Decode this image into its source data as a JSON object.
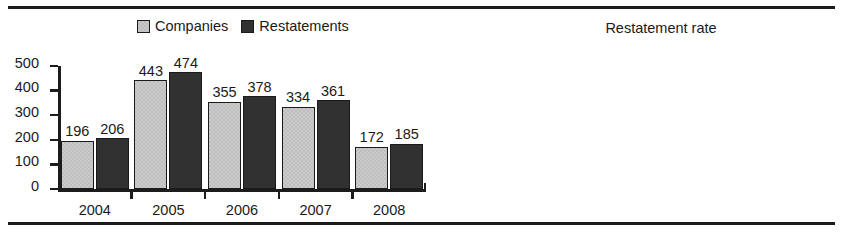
{
  "rules": {
    "top": "",
    "bottom": ""
  },
  "legend": {
    "items": [
      {
        "label": "Companies",
        "key": "companies",
        "color": "#cacaca"
      },
      {
        "label": "Restatements",
        "key": "restatements",
        "color": "#313131"
      }
    ]
  },
  "chart_data": [
    {
      "id": "counts",
      "type": "bar",
      "title": "",
      "xlabel": "",
      "ylabel": "",
      "ylim": [
        0,
        500
      ],
      "yticks": [
        0,
        100,
        200,
        300,
        400,
        500
      ],
      "ytick_labels": [
        "0",
        "100",
        "200",
        "300",
        "400",
        "500"
      ],
      "grid": false,
      "legend_position": "top-center",
      "categories": [
        "2004",
        "2005",
        "2006",
        "2007",
        "2008"
      ],
      "series": [
        {
          "name": "Companies",
          "color": "#cacaca",
          "values": [
            196,
            206,
            443,
            474,
            355,
            378,
            334,
            361,
            172,
            185
          ]
        }
      ],
      "grouped_series": [
        {
          "name": "Companies",
          "color": "#cacaca",
          "values": [
            196,
            443,
            355,
            334,
            172
          ]
        },
        {
          "name": "Restatements",
          "color": "#313131",
          "values": [
            206,
            474,
            378,
            361,
            185
          ]
        }
      ],
      "data_labels": {
        "companies": [
          "196",
          "443",
          "355",
          "334",
          "172"
        ],
        "restatements": [
          "206",
          "474",
          "378",
          "361",
          "185"
        ]
      }
    },
    {
      "id": "rate",
      "type": "bar",
      "title": "Restatement rate",
      "xlabel": "",
      "ylabel": "",
      "ylim": [
        0,
        15
      ],
      "yticks": [
        0,
        5,
        10,
        15
      ],
      "ytick_labels": [
        "0%",
        "5%",
        "10%",
        "15%"
      ],
      "grid": false,
      "legend_position": "none",
      "categories": [
        "2004",
        "2005",
        "2006",
        "2007",
        "2008"
      ],
      "series": [
        {
          "name": "Restatement rate",
          "color": "#cacaca",
          "values": [
            5.2,
            12.0,
            9.5,
            9.1,
            5.8
          ]
        }
      ],
      "data_labels": [
        "5.2%",
        "12.0%",
        "9.5%",
        "9.1%",
        "5.8%"
      ]
    }
  ]
}
